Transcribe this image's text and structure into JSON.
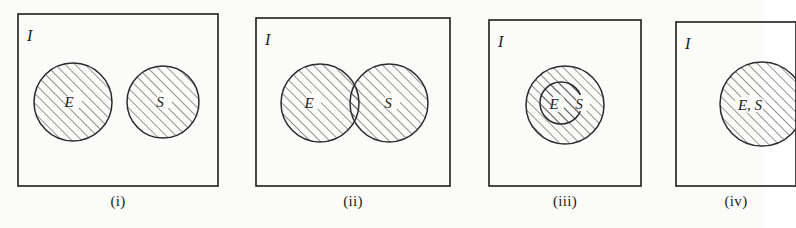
{
  "figure": {
    "kind": "set-venn-diagram-series",
    "background_color": "#fbfbf9",
    "line_color": "#2a2a2a",
    "hatch_color": "#2b2b2b",
    "universe_label": "I",
    "panels": [
      {
        "caption": "(i)",
        "universe_label": "I",
        "relation": "disjoint",
        "shaded": "both-circles",
        "sets": [
          {
            "label": "E",
            "cx": 73,
            "cy": 102,
            "r": 39
          },
          {
            "label": "S",
            "cx": 163,
            "cy": 102,
            "r": 36
          }
        ],
        "frame": {
          "x": 18,
          "y": 14,
          "w": 200,
          "h": 172
        }
      },
      {
        "caption": "(ii)",
        "universe_label": "I",
        "relation": "overlapping",
        "shaded": "both-circles",
        "sets": [
          {
            "label": "E",
            "cx": 320,
            "cy": 103,
            "r": 39
          },
          {
            "label": "S",
            "cx": 389,
            "cy": 103,
            "r": 39
          }
        ],
        "frame": {
          "x": 256,
          "y": 18,
          "w": 194,
          "h": 168
        }
      },
      {
        "caption": "(iii)",
        "universe_label": "I",
        "relation": "subset",
        "shaded": "both-circles",
        "sets": [
          {
            "label": "S",
            "cx": 565,
            "cy": 105,
            "r": 39
          },
          {
            "label": "E",
            "cx": 561,
            "cy": 103,
            "r": 21
          }
        ],
        "frame": {
          "x": 489,
          "y": 20,
          "w": 152,
          "h": 166
        }
      },
      {
        "caption": "(iv)",
        "universe_label": "I",
        "relation": "identical",
        "shaded": "single-circle",
        "sets": [
          {
            "label": "E, S",
            "cx": 762,
            "cy": 104,
            "r": 42
          }
        ],
        "frame": {
          "x": 676,
          "y": 22,
          "w": 120,
          "h": 164
        }
      }
    ]
  }
}
